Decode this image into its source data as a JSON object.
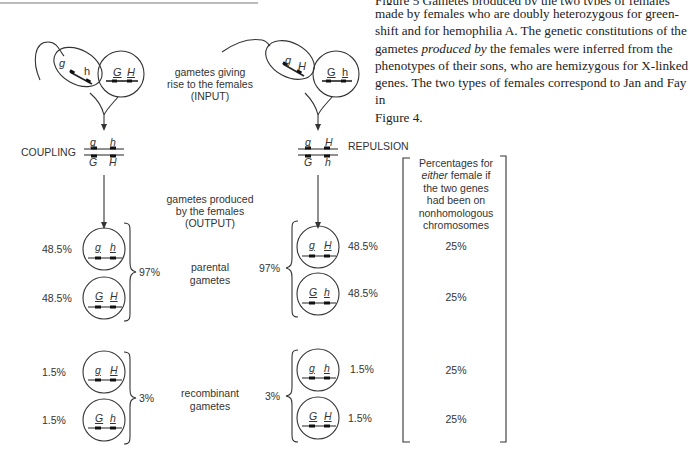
{
  "caption": {
    "line0_cut": "Figure 5  Gametes produced by the two types of females",
    "line1": "made by females who are doubly heterozygous for green-",
    "line2": "shift and for hemophilia A. The genetic constitutions of the",
    "line3_pre": "gametes ",
    "line3_em": "produced by",
    "line3_post": " the females were inferred from the",
    "line4": "phenotypes of their sons, who are hemizygous for X-linked",
    "line5": "genes. The two types of females correspond to Jan and Fay in",
    "line6": "Figure 4."
  },
  "input_label": {
    "line1": "gametes giving",
    "line2": "rise to the females",
    "line3": "(INPUT)"
  },
  "output_label": {
    "line1": "gametes produced",
    "line2": "by the females",
    "line3": "(OUTPUT)"
  },
  "parental_label": {
    "line1": "parental",
    "line2": "gametes"
  },
  "recombinant_label": {
    "line1": "recombinant",
    "line2": "gametes"
  },
  "coupling": {
    "label": "COUPLING",
    "sperm_alleles": [
      "g",
      "h"
    ],
    "egg_alleles": [
      "G",
      "H"
    ],
    "genotype_top": [
      "g",
      "h"
    ],
    "genotype_bottom": [
      "G",
      "H"
    ],
    "parental_total": "97%",
    "recombinant_total": "3%",
    "gametes": [
      {
        "alleles": [
          "g",
          "h"
        ],
        "pct": "48.5%",
        "type": "parental"
      },
      {
        "alleles": [
          "G",
          "H"
        ],
        "pct": "48.5%",
        "type": "parental"
      },
      {
        "alleles": [
          "g",
          "H"
        ],
        "pct": "1.5%",
        "type": "recombinant"
      },
      {
        "alleles": [
          "G",
          "h"
        ],
        "pct": "1.5%",
        "type": "recombinant"
      }
    ]
  },
  "repulsion": {
    "label": "REPULSION",
    "sperm_alleles": [
      "g",
      "H"
    ],
    "egg_alleles": [
      "G",
      "h"
    ],
    "genotype_top": [
      "g",
      "H"
    ],
    "genotype_bottom": [
      "G",
      "h"
    ],
    "parental_total": "97%",
    "recombinant_total": "3%",
    "gametes": [
      {
        "alleles": [
          "g",
          "H"
        ],
        "pct": "48.5%",
        "type": "parental"
      },
      {
        "alleles": [
          "G",
          "h"
        ],
        "pct": "48.5%",
        "type": "parental"
      },
      {
        "alleles": [
          "g",
          "h"
        ],
        "pct": "1.5%",
        "type": "recombinant"
      },
      {
        "alleles": [
          "G",
          "H"
        ],
        "pct": "1.5%",
        "type": "recombinant"
      }
    ]
  },
  "independent_box": {
    "line1": "Percentages for",
    "line2_em": "either",
    "line2_rest": " female if",
    "line3": "the two genes",
    "line4": "had been on",
    "line5": "nonhomologous",
    "line6": "chromosomes",
    "values": [
      "25%",
      "25%",
      "25%",
      "25%"
    ]
  }
}
